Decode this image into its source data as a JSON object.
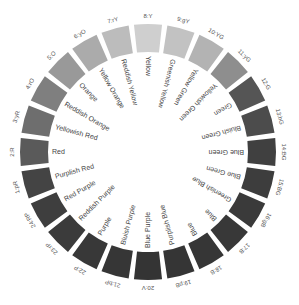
{
  "diagram": {
    "title": "",
    "type": "color-wheel",
    "center": [
      148,
      152
    ],
    "segments": [
      {
        "code": "8:Y",
        "name": "Yellow",
        "color": "#cfcfcf"
      },
      {
        "code": "9:gY",
        "name": "Greenish Yellow",
        "color": "#c2c2c2"
      },
      {
        "code": "10:YG",
        "name": "Yellow Green",
        "color": "#b3b3b3"
      },
      {
        "code": "11:yG",
        "name": "Yellowish Green",
        "color": "#8e8e8e"
      },
      {
        "code": "12:G",
        "name": "Green",
        "color": "#555555"
      },
      {
        "code": "13:bG",
        "name": "Bluish Green",
        "color": "#4c4c4c"
      },
      {
        "code": "14:BG",
        "name": "Blue Green",
        "color": "#404040"
      },
      {
        "code": "15:BG",
        "name": "Blue Green",
        "color": "#3d3d3d"
      },
      {
        "code": "16:gB",
        "name": "Greenish Blue",
        "color": "#3a3a3a"
      },
      {
        "code": "17:B",
        "name": "Blue",
        "color": "#383838"
      },
      {
        "code": "18:B",
        "name": "Blue",
        "color": "#363636"
      },
      {
        "code": "19:pB",
        "name": "Purplish Blue",
        "color": "#353535"
      },
      {
        "code": "20:V",
        "name": "Blue Purple",
        "color": "#343434"
      },
      {
        "code": "21:bP",
        "name": "Bluish Purple",
        "color": "#363636"
      },
      {
        "code": "22:P",
        "name": "Purple",
        "color": "#383838"
      },
      {
        "code": "23:rP",
        "name": "Reddish Purple",
        "color": "#3b3b3b"
      },
      {
        "code": "24:RP",
        "name": "Red Purple",
        "color": "#3e3e3e"
      },
      {
        "code": "1:pR",
        "name": "Purplish Red",
        "color": "#444444"
      },
      {
        "code": "2:R",
        "name": "Red",
        "color": "#5a5a5a"
      },
      {
        "code": "3:yR",
        "name": "Yellowish Red",
        "color": "#6e6e6e"
      },
      {
        "code": "4:rO",
        "name": "Reddish Orange",
        "color": "#7f7f7f"
      },
      {
        "code": "5:O",
        "name": "Orange",
        "color": "#999999"
      },
      {
        "code": "6:yO",
        "name": "Yellow Orange",
        "color": "#ababab"
      },
      {
        "code": "7:rY",
        "name": "Reddish Yellow",
        "color": "#bcbcbc"
      }
    ]
  }
}
